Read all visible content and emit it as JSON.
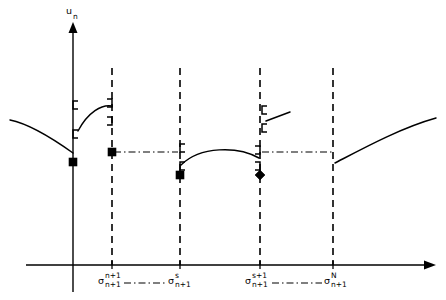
{
  "figure": {
    "type": "line-diagram",
    "background_color": "#ffffff",
    "stroke_color": "#000000",
    "width": 446,
    "height": 300
  },
  "axes": {
    "y_axis": {
      "label_base": "u",
      "label_sub": "n",
      "x": 73,
      "top_y": 28,
      "bottom_y": 292,
      "arrow": "up-arrowhead"
    },
    "x_axis": {
      "y": 265,
      "left_x": 26,
      "right_x": 430,
      "arrow": "right-arrowhead"
    }
  },
  "x_ticks": [
    {
      "id": "sigma-n-plus-1",
      "x": 112,
      "base": "σ",
      "sup": "n+1",
      "sub": "n+1",
      "label_x": 100,
      "label_y": 281
    },
    {
      "id": "sigma-s",
      "x": 180,
      "base": "σ",
      "sup": "s",
      "sub": "n+1",
      "label_x": 170,
      "label_y": 281
    },
    {
      "id": "sigma-s-plus-1",
      "x": 260,
      "base": "σ",
      "sup": "s+1",
      "sub": "n+1",
      "label_x": 245,
      "label_y": 281
    },
    {
      "id": "sigma-N",
      "x": 333,
      "base": "σ",
      "sup": "N",
      "sub": "n+1",
      "label_x": 325,
      "label_y": 281
    }
  ],
  "vertical_dashed_lines": [
    {
      "id": "vline-sigma-n-plus-1",
      "x": 112,
      "y_top": 68,
      "y_bottom": 265
    },
    {
      "id": "vline-sigma-s",
      "x": 180,
      "y_top": 68,
      "y_bottom": 265
    },
    {
      "id": "vline-sigma-s-plus-1",
      "x": 260,
      "y_top": 68,
      "y_bottom": 265
    },
    {
      "id": "vline-sigma-N",
      "x": 333,
      "y_top": 68,
      "y_bottom": 265
    }
  ],
  "level_connectors": [
    {
      "id": "level-line-left",
      "x1": 114,
      "x2": 178,
      "y": 152
    },
    {
      "id": "level-line-right",
      "x1": 262,
      "x2": 332,
      "y": 152
    }
  ],
  "label_connectors": [
    {
      "id": "label-link-1",
      "x1": 124,
      "x2": 166,
      "y": 283
    },
    {
      "id": "label-link-2",
      "x1": 272,
      "x2": 322,
      "y": 283
    }
  ],
  "curves": [
    {
      "id": "branch-left-outer",
      "description": "descending curve from left edge down to y-axis",
      "path": "M 10 120 C 30 124, 52 138, 73 153"
    },
    {
      "id": "branch-1-arc",
      "description": "arc between y-axis and sigma n+1 line",
      "path": "M 78 131 C 88 112, 102 104, 112 106"
    },
    {
      "id": "branch-2-arc",
      "description": "arc between sigma s and sigma s+1 lines",
      "path": "M 181 165 C 200 146, 238 146, 259 158"
    },
    {
      "id": "branch-3-segment",
      "description": "short rising segment right of sigma s+1",
      "path": "M 266 121 L 290 112"
    },
    {
      "id": "branch-right-outer",
      "description": "rising curve from sigma N line to right edge",
      "path": "M 335 163 C 360 150, 400 128, 436 118"
    }
  ],
  "brackets": [
    {
      "id": "bracket-yaxis-upper",
      "x": 73,
      "y": 105,
      "dir": "right"
    },
    {
      "id": "bracket-yaxis-lower",
      "x": 73,
      "y": 134,
      "dir": "right"
    },
    {
      "id": "bracket-sigma-n1-upper",
      "x": 112,
      "y": 103,
      "dir": "left"
    },
    {
      "id": "bracket-sigma-n1-lower",
      "x": 112,
      "y": 121,
      "dir": "left"
    },
    {
      "id": "bracket-sigma-s-upper",
      "x": 180,
      "y": 148,
      "dir": "right"
    },
    {
      "id": "bracket-sigma-s-lower",
      "x": 180,
      "y": 166,
      "dir": "right"
    },
    {
      "id": "bracket-sigma-s1-upper",
      "x": 260,
      "y": 150,
      "dir": "left"
    },
    {
      "id": "bracket-sigma-s1-lower",
      "x": 260,
      "y": 166,
      "dir": "left"
    },
    {
      "id": "bracket-seg3-upper",
      "x": 262,
      "y": 110,
      "dir": "right"
    },
    {
      "id": "bracket-seg3-lower",
      "x": 262,
      "y": 128,
      "dir": "right"
    }
  ],
  "markers": [
    {
      "id": "marker-yaxis",
      "shape": "square",
      "x": 73,
      "y": 162
    },
    {
      "id": "marker-sigma-n-plus-1",
      "shape": "square",
      "x": 112,
      "y": 152
    },
    {
      "id": "marker-sigma-s",
      "shape": "square",
      "x": 180,
      "y": 175
    },
    {
      "id": "marker-sigma-s-plus-1",
      "shape": "diamond",
      "x": 260,
      "y": 175
    }
  ]
}
